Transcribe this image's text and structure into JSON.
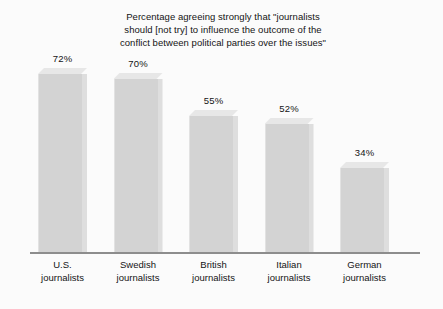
{
  "chart_data": {
    "type": "bar",
    "title": "Percentage agreeing strongly that \"journalists\nshould [not try] to influence the outcome of the\nconflict between political parties over the issues\"",
    "xlabel": "",
    "ylabel": "",
    "ylim": [
      0,
      100
    ],
    "grid": false,
    "legend": "none",
    "style": "3d-blocks",
    "categories": [
      "U.S.\njournalists",
      "Swedish\njournalists",
      "British\njournalists",
      "Italian\njournalists",
      "German\njournalists"
    ],
    "values": [
      72,
      70,
      55,
      52,
      34
    ],
    "value_labels": [
      "72%",
      "70%",
      "55%",
      "52%",
      "34%"
    ],
    "colors": {
      "bar_front": "#d3d3d3",
      "bar_side": "#dedede",
      "bar_top": "#e7e7e7",
      "axis": "#8d8d8d",
      "text": "#141414",
      "background": "#fbfbfb"
    }
  }
}
